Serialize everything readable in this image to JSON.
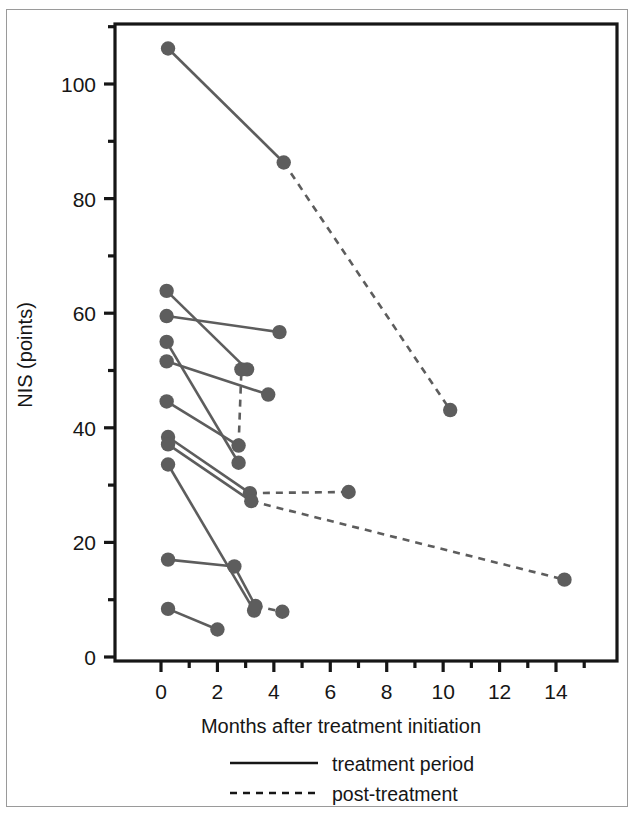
{
  "chart_data": {
    "type": "line",
    "title": "",
    "subtitle": "",
    "xlabel": "Months after treatment initiation",
    "ylabel": "NIS (points)",
    "xlim": [
      -0.9,
      16.2
    ],
    "ylim": [
      0,
      110
    ],
    "x_ticks": [
      0,
      2,
      4,
      6,
      8,
      10,
      12,
      14
    ],
    "x_tick_labels": [
      "0",
      "2",
      "4",
      "6",
      "8",
      "10",
      "12",
      "14"
    ],
    "x_minor_ticks": [
      1,
      3,
      5,
      7,
      9,
      11,
      13,
      15
    ],
    "y_ticks": [
      0,
      20,
      40,
      60,
      80,
      100
    ],
    "y_tick_labels": [
      "0",
      "20",
      "40",
      "60",
      "80",
      "100"
    ],
    "y_minor_ticks": [
      10,
      30,
      50,
      70,
      90,
      110
    ],
    "grid": false,
    "legend_position": "below-axis",
    "marker_color": "#5d5d5d",
    "line_color": "#5d5d5d",
    "axis_color": "#161616",
    "legend": [
      {
        "name": "treatment period",
        "style": "solid"
      },
      {
        "name": "post-treatment",
        "style": "dashed"
      }
    ],
    "series": [
      {
        "name": "patient-1",
        "points": [
          {
            "x": 0.25,
            "y": 106.2,
            "style": "solid"
          },
          {
            "x": 4.35,
            "y": 86.3,
            "style": "dashed"
          },
          {
            "x": 10.25,
            "y": 43.1,
            "style": "end"
          }
        ]
      },
      {
        "name": "patient-2",
        "points": [
          {
            "x": 0.2,
            "y": 63.9,
            "style": "solid"
          },
          {
            "x": 3.05,
            "y": 50.2,
            "style": "end"
          }
        ]
      },
      {
        "name": "patient-3",
        "points": [
          {
            "x": 0.2,
            "y": 59.5,
            "style": "solid"
          },
          {
            "x": 4.2,
            "y": 56.7,
            "style": "end"
          }
        ]
      },
      {
        "name": "patient-4",
        "points": [
          {
            "x": 0.2,
            "y": 55.0,
            "style": "solid"
          },
          {
            "x": 2.75,
            "y": 33.9,
            "style": "end"
          }
        ]
      },
      {
        "name": "patient-5",
        "points": [
          {
            "x": 0.2,
            "y": 51.6,
            "style": "solid"
          },
          {
            "x": 3.8,
            "y": 45.8,
            "style": "end"
          }
        ]
      },
      {
        "name": "patient-6",
        "points": [
          {
            "x": 0.2,
            "y": 44.6,
            "style": "solid"
          },
          {
            "x": 2.75,
            "y": 36.9,
            "style": "dashed"
          },
          {
            "x": 2.85,
            "y": 50.2,
            "style": "end"
          }
        ]
      },
      {
        "name": "patient-7",
        "points": [
          {
            "x": 0.25,
            "y": 38.4,
            "style": "solid"
          },
          {
            "x": 3.15,
            "y": 28.6,
            "style": "dashed"
          },
          {
            "x": 6.65,
            "y": 28.8,
            "style": "end"
          }
        ]
      },
      {
        "name": "patient-8",
        "points": [
          {
            "x": 0.25,
            "y": 37.1,
            "style": "solid"
          },
          {
            "x": 3.2,
            "y": 27.2,
            "style": "dashed"
          },
          {
            "x": 14.3,
            "y": 13.5,
            "style": "end"
          }
        ]
      },
      {
        "name": "patient-9",
        "points": [
          {
            "x": 0.25,
            "y": 33.6,
            "style": "solid"
          },
          {
            "x": 3.3,
            "y": 8.1,
            "style": "end"
          }
        ]
      },
      {
        "name": "patient-10",
        "points": [
          {
            "x": 0.25,
            "y": 17.0,
            "style": "solid"
          },
          {
            "x": 2.6,
            "y": 15.8,
            "style": "solid"
          },
          {
            "x": 3.35,
            "y": 8.9,
            "style": "dashed"
          },
          {
            "x": 4.3,
            "y": 7.9,
            "style": "end"
          }
        ]
      },
      {
        "name": "patient-11",
        "points": [
          {
            "x": 0.25,
            "y": 8.4,
            "style": "solid"
          },
          {
            "x": 2.0,
            "y": 4.8,
            "style": "end"
          }
        ]
      }
    ]
  }
}
